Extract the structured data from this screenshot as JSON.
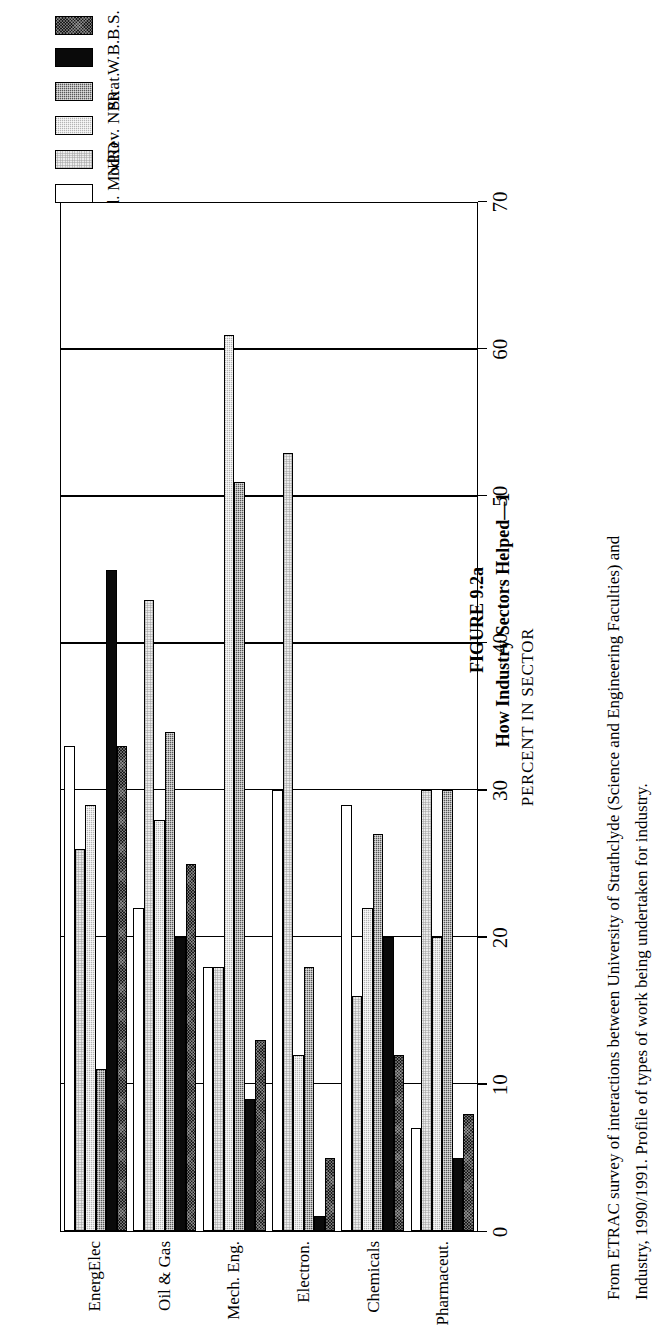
{
  "figure": {
    "number": "FIGURE 9.2a",
    "title": "How Industry Sectors Helped—1",
    "caption_line1": "From ETRAC survey of interactions between University of Strathclyde (Science and Engineering Faculties) and",
    "caption_line2": "Industry, 1990/1991. Profile of types of work being undertaken for industry."
  },
  "axis": {
    "title": "PERCENT IN SECTOR",
    "ticks": [
      "0",
      "10",
      "20",
      "30",
      "40",
      "50",
      "60",
      "70"
    ]
  },
  "legend": {
    "items": [
      {
        "label": "B.S.",
        "swatch": "dark-crosshatch-swatch",
        "fill": "f-bs"
      },
      {
        "label": "W.B.",
        "swatch": "solid-black-swatch",
        "fill": "f-wb"
      },
      {
        "label": "Strat.",
        "swatch": "medium-checker-swatch",
        "fill": "f-strat"
      },
      {
        "label": "Rev. NPR",
        "swatch": "light-checker-swatch",
        "fill": "f-rev"
      },
      {
        "label": "NPD",
        "swatch": "pale-checker-swatch",
        "fill": "f-npd"
      },
      {
        "label": "Prod. Mod.",
        "swatch": "white-swatch",
        "fill": "f-prod"
      }
    ]
  },
  "chart_data": {
    "type": "bar",
    "orientation": "horizontal",
    "title": "How Industry Sectors Helped—1",
    "xlabel": "PERCENT IN SECTOR",
    "ylabel": "",
    "xlim": [
      0,
      70
    ],
    "xticks": [
      0,
      10,
      20,
      30,
      40,
      50,
      60,
      70
    ],
    "grid": true,
    "legend_position": "top-right",
    "categories": [
      "Pharmaceut.",
      "Chemicals",
      "Electron.",
      "Mech. Eng.",
      "Oil & Gas",
      "EnergElec"
    ],
    "series": [
      {
        "name": "B.S.",
        "values": [
          33,
          25,
          13,
          5,
          12,
          8
        ]
      },
      {
        "name": "W.B.",
        "values": [
          45,
          20,
          9,
          1,
          20,
          5
        ]
      },
      {
        "name": "Strat.",
        "values": [
          11,
          34,
          51,
          18,
          27,
          30
        ]
      },
      {
        "name": "Rev. NPR",
        "values": [
          29,
          28,
          61,
          12,
          22,
          20
        ]
      },
      {
        "name": "NPD",
        "values": [
          26,
          43,
          18,
          53,
          16,
          30
        ]
      },
      {
        "name": "Prod. Mod.",
        "values": [
          33,
          22,
          18,
          30,
          29,
          7
        ]
      }
    ]
  }
}
